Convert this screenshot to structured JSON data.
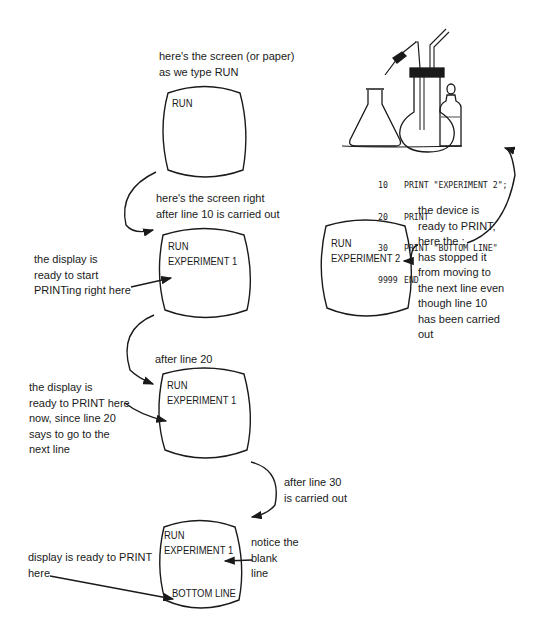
{
  "diagram": {
    "screens": [
      {
        "id": "screen-1",
        "caption": [
          "here's the screen (or paper)",
          "as we type RUN"
        ],
        "lines": [
          "RUN"
        ]
      },
      {
        "id": "screen-2",
        "caption": [
          "here's the screen right",
          "after line 10 is carried out"
        ],
        "lines": [
          "RUN",
          "EXPERIMENT 1"
        ]
      },
      {
        "id": "screen-3",
        "caption": [
          "after line 20"
        ],
        "lines": [
          "RUN",
          "EXPERIMENT 1"
        ]
      },
      {
        "id": "screen-4",
        "caption": [
          "after line 30",
          "is carried out"
        ],
        "lines": [
          "RUN",
          "EXPERIMENT 1",
          "BOTTOM LINE"
        ]
      },
      {
        "id": "screen-right",
        "lines": [
          "RUN",
          "EXPERIMENT 2"
        ]
      }
    ],
    "notes": {
      "ready_to_start": [
        "the display is",
        "ready to start",
        "PRINTing right here"
      ],
      "ready_after_20": [
        "the display is",
        "ready to PRINT here",
        "now, since line 20",
        "says to go to the",
        "next line"
      ],
      "ready_bottom": [
        "display is ready to PRINT",
        "here"
      ],
      "blank_line": [
        "notice the",
        "blank",
        "line"
      ],
      "semicolon": [
        "the device is",
        "ready to PRINT;",
        "here the ;",
        "has stopped it",
        "from moving to",
        "the next line even",
        "though line 10",
        "has been carried",
        "out"
      ]
    },
    "program": [
      {
        "line": "10",
        "stmt": "PRINT \"EXPERIMENT 2\";"
      },
      {
        "line": "20",
        "stmt": "PRINT"
      },
      {
        "line": "30",
        "stmt": "PRINT \"BOTTOM LINE\""
      },
      {
        "line": "9999",
        "stmt": "END"
      }
    ],
    "illustration": "lab-glassware-icon"
  }
}
